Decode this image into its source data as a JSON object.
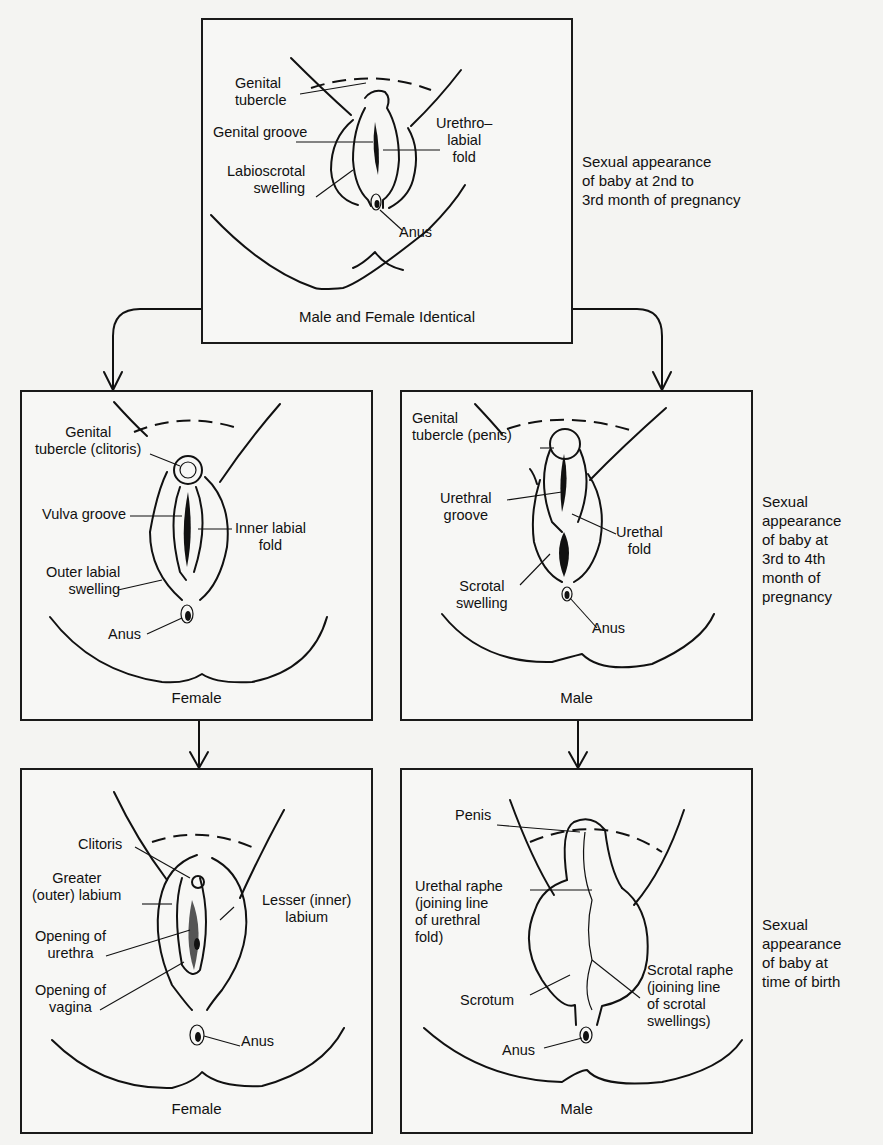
{
  "diagram": {
    "stage1": {
      "caption": "Male and Female Identical",
      "side_note": "Sexual appearance\nof baby at 2nd to\n3rd month of pregnancy",
      "labels": {
        "genital_tubercle": "Genital\ntubercle",
        "genital_groove": "Genital groove",
        "labioscrotal_swelling": "Labioscrotal\nswelling",
        "urethrolabial_fold": "Urethro–\nlabial\nfold",
        "anus": "Anus"
      }
    },
    "stage2": {
      "side_note": "Sexual\nappearance\nof baby at\n3rd to 4th\nmonth of\npregnancy",
      "female": {
        "caption": "Female",
        "labels": {
          "genital_tubercle": "Genital\ntubercle (clitoris)",
          "vulva_groove": "Vulva groove",
          "inner_labial_fold": "Inner labial\nfold",
          "outer_labial_swelling": "Outer labial\nswelling",
          "anus": "Anus"
        }
      },
      "male": {
        "caption": "Male",
        "labels": {
          "genital_tubercle": "Genital\ntubercle (penis)",
          "urethral_groove": "Urethral\ngroove",
          "urethal_fold": "Urethal\nfold",
          "scrotal_swelling": "Scrotal\nswelling",
          "anus": "Anus"
        }
      }
    },
    "stage3": {
      "side_note": "Sexual\nappearance\nof baby at\ntime of birth",
      "female": {
        "caption": "Female",
        "labels": {
          "clitoris": "Clitoris",
          "greater_labium": "Greater\n(outer) labium",
          "lesser_labium": "Lesser (inner)\nlabium",
          "opening_urethra": "Opening of\nurethra",
          "opening_vagina": "Opening of\nvagina",
          "anus": "Anus"
        }
      },
      "male": {
        "caption": "Male",
        "labels": {
          "penis": "Penis",
          "urethal_raphe": "Urethal raphe\n(joining line\nof urethral\nfold)",
          "scrotal_raphe": "Scrotal raphe\n(joining line\nof scrotal\nswellings)",
          "scrotum": "Scrotum",
          "anus": "Anus"
        }
      }
    }
  }
}
